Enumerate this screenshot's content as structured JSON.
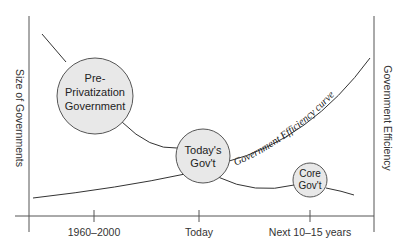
{
  "diagram": {
    "left_axis_title": "Size of Governments",
    "right_axis_title": "Government Efficiency",
    "curve_label": "Government Efficiency curve",
    "x_ticks": [
      "1960–2000",
      "Today",
      "Next 10–15 years"
    ],
    "bubbles": [
      {
        "lines": [
          "Pre-",
          "Privatization",
          "Government"
        ]
      },
      {
        "lines": [
          "Today's",
          "Gov't"
        ]
      },
      {
        "lines": [
          "Core",
          "Gov't"
        ]
      }
    ],
    "colors": {
      "bubble_fill": "#e8e8e8",
      "line": "#333333"
    }
  }
}
